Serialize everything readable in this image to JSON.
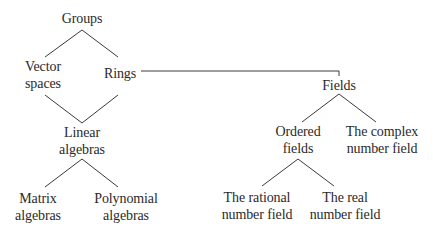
{
  "diagram": {
    "type": "hierarchy",
    "nodes": {
      "groups": {
        "lines": [
          "Groups"
        ]
      },
      "vector_spaces": {
        "lines": [
          "Vector",
          "spaces"
        ]
      },
      "rings": {
        "lines": [
          "Rings"
        ]
      },
      "linear_algebras": {
        "lines": [
          "Linear",
          "algebras"
        ]
      },
      "matrix_algebras": {
        "lines": [
          "Matrix",
          "algebras"
        ]
      },
      "polynomial_algebras": {
        "lines": [
          "Polynomial",
          "algebras"
        ]
      },
      "fields": {
        "lines": [
          "Fields"
        ]
      },
      "ordered_fields": {
        "lines": [
          "Ordered",
          "fields"
        ]
      },
      "complex_field": {
        "lines": [
          "The complex",
          "number field"
        ]
      },
      "rational_field": {
        "lines": [
          "The rational",
          "number field"
        ]
      },
      "real_field": {
        "lines": [
          "The real",
          "number field"
        ]
      }
    },
    "edges": [
      [
        "Groups",
        "Vector spaces"
      ],
      [
        "Groups",
        "Rings"
      ],
      [
        "Vector spaces",
        "Linear algebras"
      ],
      [
        "Rings",
        "Linear algebras"
      ],
      [
        "Rings",
        "Fields"
      ],
      [
        "Linear algebras",
        "Matrix algebras"
      ],
      [
        "Linear algebras",
        "Polynomial algebras"
      ],
      [
        "Fields",
        "Ordered fields"
      ],
      [
        "Fields",
        "The complex number field"
      ],
      [
        "Ordered fields",
        "The rational number field"
      ],
      [
        "Ordered fields",
        "The real number field"
      ]
    ],
    "line_color": "#3a3a3a"
  }
}
